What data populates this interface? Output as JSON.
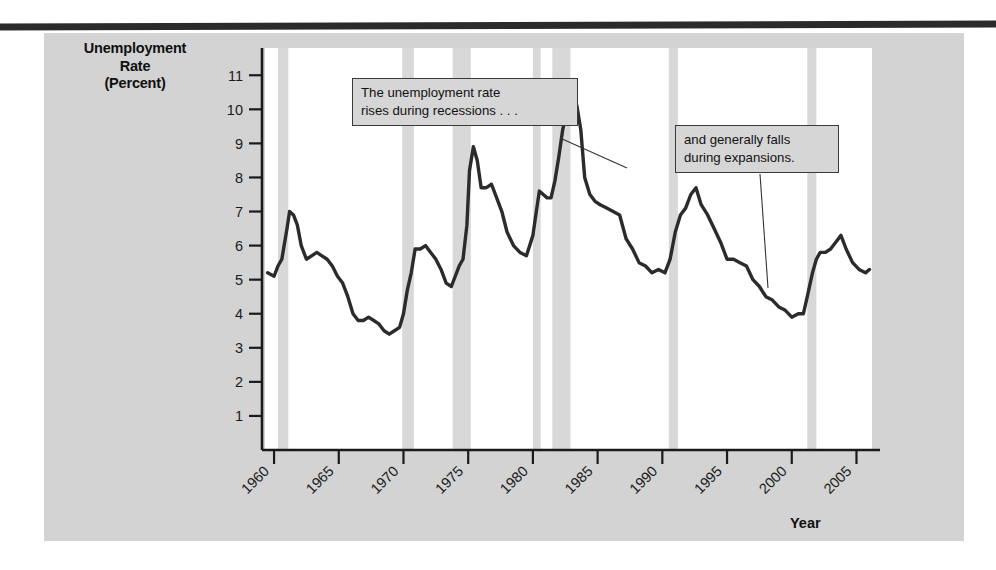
{
  "figure": {
    "ylabel_line1": "Unemployment",
    "ylabel_line2": "Rate",
    "ylabel_line3": "(Percent)",
    "xlabel": "Year",
    "accent_line_color": "#2b2b2b",
    "recession_band_color": "#d8d8d8",
    "panel_color": "#d3d3d3",
    "plot_background": "#ffffff"
  },
  "annotations": {
    "recessions": "The unemployment rate\nrises during recessions . . .",
    "expansions": "and generally falls\nduring expansions."
  },
  "chart_data": {
    "type": "line",
    "title": "",
    "subtitle": "",
    "xlabel": "Year",
    "ylabel": "Unemployment Rate (Percent)",
    "xlim": [
      1959.3,
      2006.2
    ],
    "ylim": [
      0,
      11.8
    ],
    "ytick_values": [
      1,
      2,
      3,
      4,
      5,
      6,
      7,
      8,
      9,
      10,
      11
    ],
    "ytick_labels": [
      "1",
      "2",
      "3",
      "4",
      "5",
      "6",
      "7",
      "8",
      "9",
      "10",
      "11"
    ],
    "xtick_values": [
      1960,
      1965,
      1970,
      1975,
      1980,
      1985,
      1990,
      1995,
      2000,
      2005
    ],
    "xtick_labels": [
      "1960",
      "1965",
      "1970",
      "1975",
      "1980",
      "1985",
      "1990",
      "1995",
      "2000",
      "2005"
    ],
    "grid": false,
    "legend": null,
    "series": [
      {
        "name": "Unemployment Rate",
        "color": "#2b2b2b",
        "x": [
          1959.5,
          1960.0,
          1960.3,
          1960.6,
          1961.0,
          1961.2,
          1961.5,
          1961.8,
          1962.1,
          1962.5,
          1962.9,
          1963.3,
          1963.7,
          1964.1,
          1964.5,
          1964.9,
          1965.3,
          1965.7,
          1966.1,
          1966.5,
          1966.9,
          1967.3,
          1967.7,
          1968.1,
          1968.5,
          1968.9,
          1969.3,
          1969.7,
          1970.0,
          1970.3,
          1970.6,
          1970.9,
          1971.3,
          1971.7,
          1972.1,
          1972.5,
          1972.9,
          1973.3,
          1973.7,
          1974.0,
          1974.3,
          1974.6,
          1974.9,
          1975.1,
          1975.4,
          1975.7,
          1976.0,
          1976.4,
          1976.8,
          1977.2,
          1977.6,
          1978.0,
          1978.5,
          1979.0,
          1979.5,
          1980.0,
          1980.3,
          1980.5,
          1980.8,
          1981.1,
          1981.4,
          1981.7,
          1982.0,
          1982.3,
          1982.6,
          1982.9,
          1983.1,
          1983.4,
          1983.7,
          1984.0,
          1984.4,
          1984.8,
          1985.2,
          1985.7,
          1986.2,
          1986.7,
          1987.2,
          1987.7,
          1988.2,
          1988.7,
          1989.2,
          1989.7,
          1990.2,
          1990.6,
          1991.0,
          1991.4,
          1991.8,
          1992.2,
          1992.6,
          1993.0,
          1993.5,
          1994.0,
          1994.5,
          1995.0,
          1995.5,
          1996.0,
          1996.5,
          1997.0,
          1997.5,
          1998.0,
          1998.5,
          1999.0,
          1999.5,
          2000.0,
          2000.5,
          2000.9,
          2001.2,
          2001.6,
          2001.9,
          2002.2,
          2002.6,
          2003.0,
          2003.4,
          2003.8,
          2004.2,
          2004.7,
          2005.2,
          2005.7,
          2006.0
        ],
        "y": [
          5.2,
          5.1,
          5.4,
          5.6,
          6.5,
          7.0,
          6.9,
          6.6,
          6.0,
          5.6,
          5.7,
          5.8,
          5.7,
          5.6,
          5.4,
          5.1,
          4.9,
          4.5,
          4.0,
          3.8,
          3.8,
          3.9,
          3.8,
          3.7,
          3.5,
          3.4,
          3.5,
          3.6,
          4.0,
          4.7,
          5.2,
          5.9,
          5.9,
          6.0,
          5.8,
          5.6,
          5.3,
          4.9,
          4.8,
          5.1,
          5.4,
          5.6,
          6.6,
          8.2,
          8.9,
          8.5,
          7.7,
          7.7,
          7.8,
          7.4,
          7.0,
          6.4,
          6.0,
          5.8,
          5.7,
          6.3,
          7.1,
          7.6,
          7.5,
          7.4,
          7.4,
          7.9,
          8.6,
          9.4,
          9.9,
          10.7,
          10.4,
          10.1,
          9.4,
          8.0,
          7.5,
          7.3,
          7.2,
          7.1,
          7.0,
          6.9,
          6.2,
          5.9,
          5.5,
          5.4,
          5.2,
          5.3,
          5.2,
          5.6,
          6.4,
          6.9,
          7.1,
          7.5,
          7.7,
          7.2,
          6.9,
          6.5,
          6.1,
          5.6,
          5.6,
          5.5,
          5.4,
          5.0,
          4.8,
          4.5,
          4.4,
          4.2,
          4.1,
          3.9,
          4.0,
          4.0,
          4.5,
          5.2,
          5.6,
          5.8,
          5.8,
          5.9,
          6.1,
          6.3,
          5.9,
          5.5,
          5.3,
          5.2,
          5.3
        ]
      }
    ],
    "recession_bands": [
      {
        "start": 1960.3,
        "end": 1961.1
      },
      {
        "start": 1969.9,
        "end": 1970.8
      },
      {
        "start": 1973.8,
        "end": 1975.2
      },
      {
        "start": 1980.0,
        "end": 1980.6
      },
      {
        "start": 1981.5,
        "end": 1982.9
      },
      {
        "start": 1990.5,
        "end": 1991.2
      },
      {
        "start": 2001.2,
        "end": 2001.9
      }
    ],
    "annotations": [
      {
        "text": "The unemployment rate rises during recessions . . .",
        "leader_from": [
          560,
          138
        ],
        "leader_to": [
          627,
          168
        ]
      },
      {
        "text": "and generally falls during expansions.",
        "leader_from": [
          760,
          174
        ],
        "leader_to": [
          768,
          288
        ]
      }
    ]
  }
}
